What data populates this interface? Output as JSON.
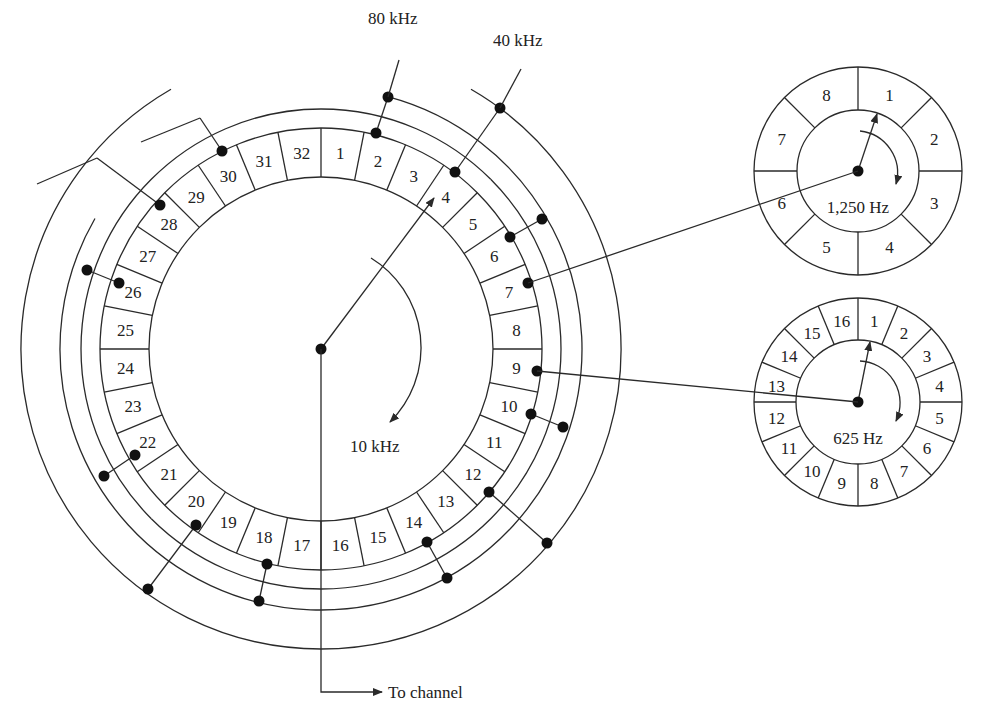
{
  "diagram": {
    "type": "commutator-multiplexing",
    "colors": {
      "line": "#2a2a2a",
      "dot": "#111111",
      "text": "#222222",
      "background": "#ffffff"
    },
    "main_wheel": {
      "center": [
        321,
        349
      ],
      "segments": 32,
      "segment_labels": [
        "1",
        "2",
        "3",
        "4",
        "5",
        "6",
        "7",
        "8",
        "9",
        "10",
        "11",
        "12",
        "13",
        "14",
        "15",
        "16",
        "17",
        "18",
        "19",
        "20",
        "21",
        "22",
        "23",
        "24",
        "25",
        "26",
        "27",
        "28",
        "29",
        "30",
        "31",
        "32"
      ],
      "rate_label": "10 kHz",
      "output_label": "To channel"
    },
    "subcommutated_lines": [
      {
        "label": "80 kHz",
        "connected_segments": [
          "2",
          "10",
          "18",
          "26"
        ]
      },
      {
        "label": "40 kHz",
        "connected_segments": [
          "4",
          "12",
          "20",
          "28"
        ]
      }
    ],
    "extra_connections": {
      "to_1250_hz_wheel": "7",
      "to_625_hz_wheel": "9",
      "additional_dot_pairs": [
        "6",
        "14",
        "22",
        "30"
      ]
    },
    "sub_wheel_1250": {
      "segments": 8,
      "segment_labels": [
        "1",
        "2",
        "3",
        "4",
        "5",
        "6",
        "7",
        "8"
      ],
      "rate_label": "1,250 Hz"
    },
    "sub_wheel_625": {
      "segments": 16,
      "segment_labels": [
        "1",
        "2",
        "3",
        "4",
        "5",
        "6",
        "7",
        "8",
        "9",
        "10",
        "11",
        "12",
        "13",
        "14",
        "15",
        "16"
      ],
      "rate_label": "625 Hz"
    }
  }
}
